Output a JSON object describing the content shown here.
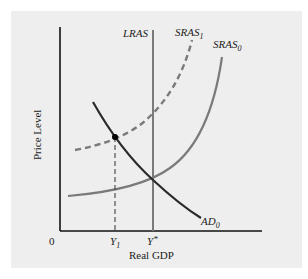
{
  "diagram": {
    "type": "AS-AD",
    "axes": {
      "y_label": "Price Level",
      "x_label": "Real GDP",
      "origin_label": "0"
    },
    "x_ticks": [
      {
        "base": "Y",
        "sub": "1"
      },
      {
        "base": "Y",
        "sup": "*"
      }
    ],
    "curves": [
      {
        "id": "LRAS",
        "label": "LRAS",
        "style": "solid",
        "color": "#7a7a7a"
      },
      {
        "id": "SRAS1",
        "label_base": "SRAS",
        "label_sub": "1",
        "style": "dashed",
        "color": "#7a7a7a"
      },
      {
        "id": "SRAS0",
        "label_base": "SRAS",
        "label_sub": "0",
        "style": "solid",
        "color": "#7a7a7a"
      },
      {
        "id": "AD0",
        "label_base": "AD",
        "label_sub": "0",
        "style": "solid",
        "color": "#2b2b2b"
      }
    ],
    "colors": {
      "panel_bg": "#eeeeee",
      "axis": "#111111",
      "supply": "#7a7a7a",
      "demand": "#2b2b2b"
    }
  }
}
